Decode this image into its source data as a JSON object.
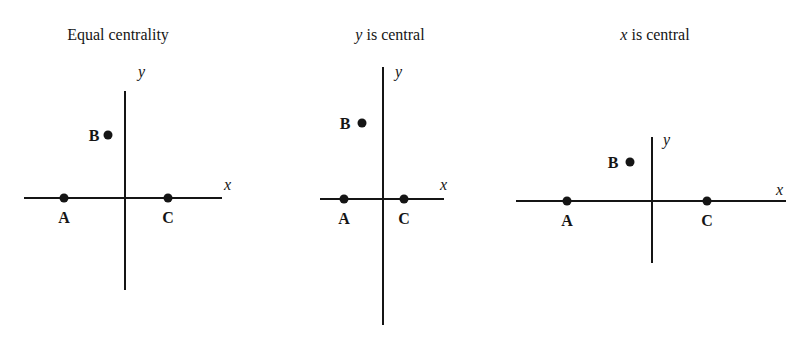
{
  "diagram": {
    "panels": [
      {
        "id": "equal",
        "title": {
          "italic": "",
          "text": "Equal centrality"
        },
        "axes": {
          "x_label": "x",
          "y_label": "y"
        },
        "points": [
          {
            "label": "A",
            "position": "on x-axis, left of origin"
          },
          {
            "label": "B",
            "position": "upper left quadrant"
          },
          {
            "label": "C",
            "position": "on x-axis, right of origin"
          }
        ]
      },
      {
        "id": "y-central",
        "title": {
          "italic": "y",
          "text": " is central"
        },
        "axes": {
          "x_label": "x",
          "y_label": "y"
        },
        "points": [
          {
            "label": "A",
            "position": "on x-axis, left of origin"
          },
          {
            "label": "B",
            "position": "upper left quadrant"
          },
          {
            "label": "C",
            "position": "on x-axis, right of origin"
          }
        ]
      },
      {
        "id": "x-central",
        "title": {
          "italic": "x",
          "text": " is central"
        },
        "axes": {
          "x_label": "x",
          "y_label": "y"
        },
        "points": [
          {
            "label": "A",
            "position": "on x-axis, left of origin"
          },
          {
            "label": "B",
            "position": "upper left quadrant"
          },
          {
            "label": "C",
            "position": "on x-axis, right of origin"
          }
        ]
      }
    ]
  }
}
